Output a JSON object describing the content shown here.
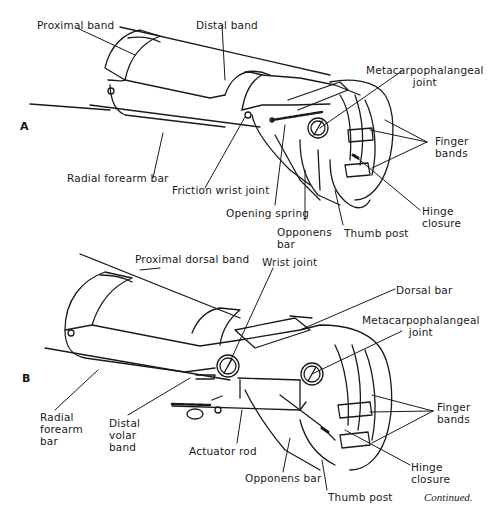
{
  "figure": {
    "panel_a": {
      "letter": "A",
      "labels": {
        "proximal_band": "Proximal band",
        "distal_band": "Distal band",
        "metacarpophalangeal_joint": "Metacarpophalangeal\njoint",
        "radial_forearm_bar": "Radial forearm bar",
        "friction_wrist_joint": "Friction wrist joint",
        "opening_spring": "Opening spring",
        "opponens_bar": "Opponens\nbar",
        "thumb_post": "Thumb post",
        "finger_bands": "Finger\nbands",
        "hinge_closure": "Hinge\nclosure"
      }
    },
    "panel_b": {
      "letter": "B",
      "labels": {
        "proximal_dorsal_band": "Proximal dorsal band",
        "wrist_joint": "Wrist joint",
        "dorsal_bar": "Dorsal bar",
        "metacarpophalangeal_joint": "Metacarpophalangeal\njoint",
        "radial_forearm_bar": "Radial\nforearm\nbar",
        "distal_volar_band": "Distal\nvolar\nband",
        "actuator_rod": "Actuator rod",
        "opponens_bar": "Opponens bar",
        "thumb_post": "Thumb post",
        "finger_bands": "Finger\nbands",
        "hinge_closure": "Hinge\nclosure"
      }
    },
    "caption": "Continued."
  },
  "colors": {
    "ink": "#1a1a1a",
    "background": "#ffffff"
  }
}
